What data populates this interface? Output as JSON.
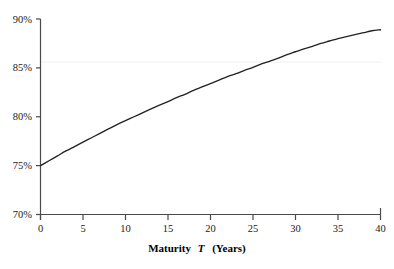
{
  "chart_data": {
    "type": "line",
    "title": "",
    "xlabel": "Maturity T (Years)",
    "xlabel_parts": {
      "lead": "Maturity",
      "symbol": "T",
      "trail": "(Years)"
    },
    "ylabel": "",
    "xlim": [
      0,
      40
    ],
    "ylim": [
      70,
      90
    ],
    "x_ticks": [
      "0",
      "5",
      "10",
      "15",
      "20",
      "25",
      "30",
      "35",
      "40"
    ],
    "x_tick_values": [
      0,
      5,
      10,
      15,
      20,
      25,
      30,
      35,
      40
    ],
    "y_ticks": [
      "70%",
      "75%",
      "80%",
      "85%",
      "90%"
    ],
    "y_tick_values": [
      70,
      75,
      80,
      85,
      90
    ],
    "grid": "faint horizontal gridline at 85%",
    "gridlines_y": [
      85
    ],
    "legend": null,
    "legend_position": "none",
    "series": [
      {
        "name": "curve",
        "color": "#222222",
        "x": [
          0,
          1,
          2,
          3,
          4,
          5,
          6,
          7,
          8,
          9,
          10,
          11,
          12,
          13,
          14,
          15,
          16,
          17,
          18,
          19,
          20,
          21,
          22,
          23,
          24,
          25,
          26,
          27,
          28,
          29,
          30,
          31,
          32,
          33,
          34,
          35,
          36,
          37,
          38,
          39,
          40
        ],
        "values": [
          75.0,
          75.5,
          76.0,
          76.5,
          76.95,
          77.4,
          77.85,
          78.3,
          78.75,
          79.2,
          79.6,
          80.0,
          80.4,
          80.8,
          81.2,
          81.55,
          81.95,
          82.3,
          82.7,
          83.05,
          83.4,
          83.75,
          84.1,
          84.4,
          84.75,
          85.05,
          85.4,
          85.7,
          86.0,
          86.35,
          86.65,
          86.95,
          87.2,
          87.5,
          87.75,
          88.0,
          88.2,
          88.4,
          88.6,
          88.8,
          88.9
        ]
      }
    ]
  },
  "figure": {
    "clipped_title": "",
    "axis_color": "#4a4a4a",
    "curve_color": "#222222",
    "grid_color": "#f0eef2",
    "background": "#ffffff"
  }
}
